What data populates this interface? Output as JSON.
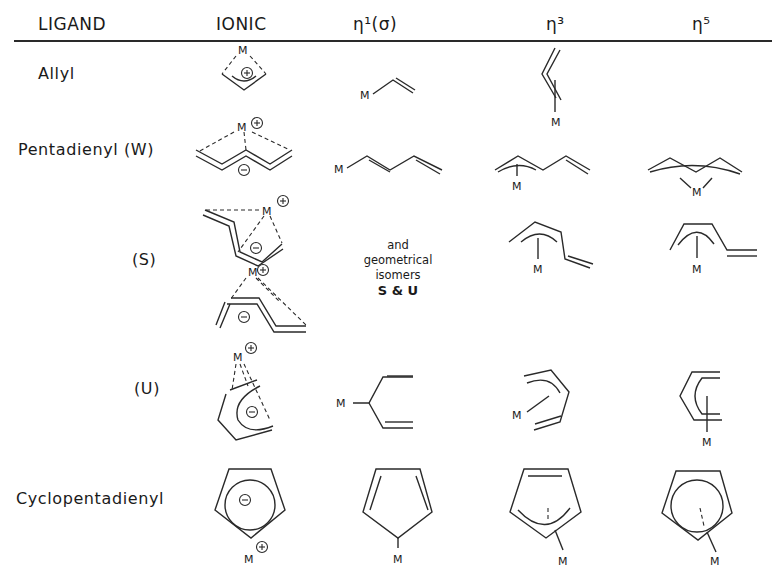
{
  "header": {
    "columns": [
      "LIGAND",
      "IONIC",
      "η¹(σ)",
      "η³",
      "η⁵"
    ]
  },
  "rows": [
    {
      "ligand": "Allyl"
    },
    {
      "ligand": "Pentadienyl (W)"
    },
    {
      "ligand": "(S)"
    },
    {
      "ligand": "(U)"
    },
    {
      "ligand": "Cyclopentadienyl"
    }
  ],
  "note": {
    "line1": "and",
    "line2": "geometrical",
    "line3": "isomers",
    "line4": "S & U"
  },
  "symbols": {
    "metal": "M",
    "plus": "+",
    "minus": "−"
  }
}
